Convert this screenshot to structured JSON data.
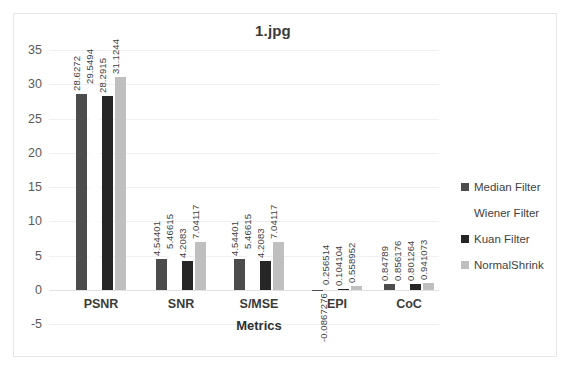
{
  "chart_data": {
    "type": "bar",
    "title": "1.jpg",
    "xlabel": "Metrics",
    "ylabel": "",
    "ylim": [
      -5,
      35
    ],
    "yticks": [
      35,
      30,
      25,
      20,
      15,
      10,
      5,
      0,
      -5
    ],
    "grid": true,
    "legend_position": "right",
    "categories": [
      "PSNR",
      "SNR",
      "S/MSE",
      "EPI",
      "CoC"
    ],
    "series": [
      {
        "name": "Median Filter",
        "color": "#4c4c4c",
        "values": [
          28.6272,
          4.54401,
          4.54401,
          -0.0867276,
          0.84789
        ],
        "labels": [
          "28.6272",
          "4.54401",
          "4.54401",
          "-0.0867276",
          "0.84789"
        ]
      },
      {
        "name": "Wiener  Filter",
        "color": "#ffffff",
        "values": [
          29.5494,
          5.46615,
          5.46615,
          0.256514,
          0.856176
        ],
        "labels": [
          "29.5494",
          "5.46615",
          "5.46615",
          "0.256514",
          "0.856176"
        ]
      },
      {
        "name": "Kuan Filter",
        "color": "#262626",
        "values": [
          28.2915,
          4.2083,
          4.2083,
          0.104104,
          0.801264
        ],
        "labels": [
          "28.2915",
          "4.2083",
          "4.2083",
          "0.104104",
          "0.801264"
        ]
      },
      {
        "name": "NormalShrink",
        "color": "#bfbfbf",
        "values": [
          31.1244,
          7.04117,
          7.04117,
          0.558952,
          0.941073
        ],
        "labels": [
          "31.1244",
          "7.04117",
          "7.04117",
          "0.558952",
          "0.941073"
        ]
      }
    ]
  }
}
